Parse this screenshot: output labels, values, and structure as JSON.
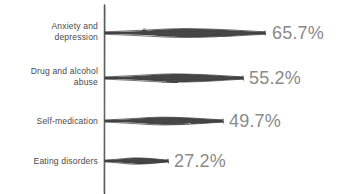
{
  "chart_data": {
    "type": "bar",
    "orientation": "horizontal",
    "title": "",
    "subtitle": "",
    "xlabel": "",
    "ylabel": "",
    "categories": [
      "Anxiety and\ndepression",
      "Drug and alcohol\nabuse",
      "Self-medication",
      "Eating disorders"
    ],
    "values": [
      65.7,
      55.2,
      49.7,
      27.2
    ],
    "value_labels": [
      "65.7%",
      "55.2%",
      "49.7%",
      "27.2%"
    ],
    "xlim": [
      0,
      100
    ],
    "grid": false,
    "legend": null,
    "style": "hand-drawn-sketch",
    "colors": {
      "bar": "#3a3a3a",
      "axis": "#4d4d4d",
      "category_label": "#4a4a4a",
      "value_label": "#8a8a8a",
      "background": "#ffffff"
    }
  },
  "bars": [
    {
      "label": "Anxiety and\ndepression",
      "value_label": "65.7%",
      "value": 65.7,
      "y": 33,
      "end_x": 265
    },
    {
      "label": "Drug and alcohol\nabuse",
      "value_label": "55.2%",
      "value": 55.2,
      "y": 78,
      "end_x": 243
    },
    {
      "label": "Self-medication",
      "value_label": "49.7%",
      "value": 49.7,
      "y": 121,
      "end_x": 223
    },
    {
      "label": "Eating disorders",
      "value_label": "27.2%",
      "value": 27.2,
      "y": 161,
      "end_x": 168
    }
  ]
}
